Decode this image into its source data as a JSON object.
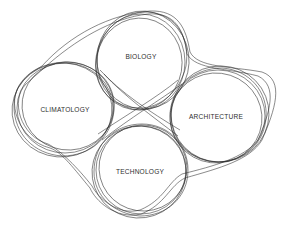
{
  "diagram": {
    "type": "overlapping-loops",
    "nodes": [
      {
        "id": "biology",
        "label": "BIOLOGY",
        "cx": 141,
        "cy": 62,
        "r": 43
      },
      {
        "id": "climatology",
        "label": "CLIMATOLOGY",
        "cx": 65,
        "cy": 108,
        "r": 46
      },
      {
        "id": "architecture",
        "label": "ARCHITECTURE",
        "cx": 218,
        "cy": 116,
        "r": 46
      },
      {
        "id": "technology",
        "label": "TECHNOLOGY",
        "cx": 141,
        "cy": 170,
        "r": 44
      }
    ],
    "stroke_color": "#2a2a2a",
    "background": "#ffffff"
  }
}
